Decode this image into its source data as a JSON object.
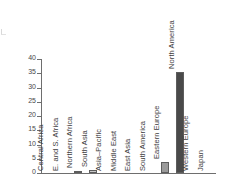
{
  "chart_data": {
    "type": "bar",
    "title": "",
    "subtitle": "",
    "xlabel": "",
    "ylabel": "",
    "ylim": [
      0,
      40
    ],
    "yticks": [
      0,
      5,
      10,
      15,
      20,
      25,
      30,
      35,
      40
    ],
    "ytick_labels": [
      "0",
      "5",
      "10",
      "15",
      "20",
      "25",
      "30",
      "35",
      "40"
    ],
    "grid": false,
    "legend": false,
    "categories": [
      "Central Africa",
      "E. and S. Africa",
      "Northern Africa",
      "South Asia",
      "Asia–Pacific",
      "Middle East",
      "East Asia",
      "South America",
      "Eastern Europe",
      "North America",
      "Western Europe",
      "Japan"
    ],
    "values": [
      0,
      0,
      0.4,
      1.2,
      0,
      0,
      0,
      0,
      4.0,
      35.5,
      0,
      0
    ],
    "bar_colors": [
      "#bdbdbd",
      "#bdbdbd",
      "#bdbdbd",
      "#c8c8c8",
      "#bdbdbd",
      "#bdbdbd",
      "#bdbdbd",
      "#bdbdbd",
      "#9a9a9a",
      "#4a4a4a",
      "#bdbdbd",
      "#bdbdbd"
    ]
  },
  "colors": {
    "axis": "#6e6e6e",
    "text": "#3d3d3d",
    "background": "#ffffff",
    "bar_dark": "#4a4a4a",
    "bar_mid": "#9a9a9a",
    "bar_light": "#c8c8c8"
  }
}
